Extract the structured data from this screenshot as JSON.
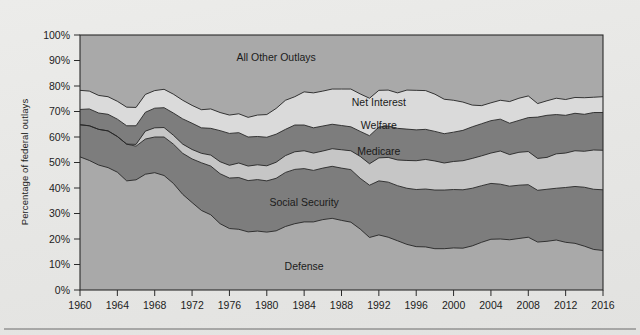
{
  "figure": {
    "background_color": "#e8e8e6",
    "plot_background_color": "#a7a7a7",
    "axis_color": "#2a2a2a",
    "has_bottom_rule": true
  },
  "chart_data": {
    "type": "area",
    "stacked": true,
    "title": "",
    "subtitle": "",
    "xlabel": "",
    "ylabel": "Percentage of federal outlays",
    "xlim": [
      1960,
      2016
    ],
    "ylim": [
      0,
      100
    ],
    "grid": false,
    "legend_position": "inline-labels",
    "ytick_labels": [
      "0%",
      "10%",
      "20%",
      "30%",
      "40%",
      "50%",
      "60%",
      "70%",
      "80%",
      "90%",
      "100%"
    ],
    "ytick_values": [
      0,
      10,
      20,
      30,
      40,
      50,
      60,
      70,
      80,
      90,
      100
    ],
    "xtick_labels": [
      "1960",
      "1964",
      "1968",
      "1972",
      "1976",
      "1980",
      "1984",
      "1988",
      "1992",
      "1996",
      "2000",
      "2004",
      "2008",
      "2012",
      "2016"
    ],
    "xtick_values": [
      1960,
      1964,
      1968,
      1972,
      1976,
      1980,
      1984,
      1988,
      1992,
      1996,
      2000,
      2004,
      2008,
      2012,
      2016
    ],
    "x": [
      1960,
      1961,
      1962,
      1963,
      1964,
      1965,
      1966,
      1967,
      1968,
      1969,
      1970,
      1971,
      1972,
      1973,
      1974,
      1975,
      1976,
      1977,
      1978,
      1979,
      1980,
      1981,
      1982,
      1983,
      1984,
      1985,
      1986,
      1987,
      1988,
      1989,
      1990,
      1991,
      1992,
      1993,
      1994,
      1995,
      1996,
      1997,
      1998,
      1999,
      2000,
      2001,
      2002,
      2003,
      2004,
      2005,
      2006,
      2007,
      2008,
      2009,
      2010,
      2011,
      2012,
      2013,
      2014,
      2015,
      2016
    ],
    "series": [
      {
        "name": "Defense",
        "color": "#a9a9a9",
        "label_x": 1984,
        "label_y": 8,
        "values": [
          52.2,
          50.8,
          49.0,
          48.0,
          46.2,
          42.8,
          43.2,
          45.4,
          46.0,
          44.9,
          41.8,
          37.5,
          34.3,
          31.2,
          29.5,
          26.0,
          24.1,
          23.8,
          22.8,
          23.1,
          22.7,
          23.2,
          24.9,
          26.0,
          26.7,
          26.7,
          27.6,
          28.1,
          27.3,
          26.6,
          23.9,
          20.6,
          21.6,
          20.7,
          19.3,
          17.9,
          17.0,
          16.9,
          16.2,
          16.2,
          16.5,
          16.4,
          17.3,
          18.7,
          19.9,
          20.0,
          19.7,
          20.2,
          20.7,
          18.8,
          19.1,
          19.6,
          18.7,
          18.3,
          17.2,
          15.9,
          15.5
        ]
      },
      {
        "name": "Social Security",
        "color": "#7d7d7d",
        "label_x": 1984,
        "label_y": 33,
        "values": [
          12.6,
          13.6,
          14.0,
          14.4,
          14.0,
          14.4,
          13.2,
          13.8,
          14.0,
          15.1,
          15.4,
          16.1,
          17.1,
          18.7,
          19.1,
          19.6,
          19.8,
          20.3,
          20.1,
          20.2,
          20.1,
          20.6,
          21.2,
          21.3,
          20.9,
          20.2,
          20.2,
          20.4,
          20.5,
          20.6,
          19.9,
          20.5,
          21.2,
          21.6,
          21.6,
          22.0,
          22.4,
          22.7,
          23.0,
          23.0,
          22.9,
          22.9,
          22.6,
          22.2,
          21.9,
          21.5,
          21.0,
          20.9,
          20.6,
          20.3,
          20.4,
          20.3,
          21.5,
          22.3,
          23.1,
          23.6,
          23.8
        ]
      },
      {
        "name": "Medicare",
        "color": "#c6c6c6",
        "label_x": 1992,
        "label_y": 53,
        "values": [
          0.0,
          0.0,
          0.0,
          0.0,
          0.0,
          0.0,
          0.7,
          3.1,
          3.6,
          3.7,
          3.5,
          3.6,
          3.7,
          3.7,
          4.3,
          4.7,
          5.0,
          5.7,
          5.7,
          5.8,
          5.9,
          6.3,
          6.6,
          6.9,
          7.0,
          6.8,
          6.7,
          6.9,
          7.2,
          7.4,
          8.6,
          8.4,
          9.0,
          9.7,
          10.1,
          10.9,
          11.3,
          11.6,
          11.4,
          10.6,
          11.0,
          11.4,
          11.7,
          11.7,
          11.9,
          13.0,
          12.4,
          12.9,
          13.0,
          12.5,
          12.5,
          13.5,
          13.5,
          14.0,
          14.1,
          15.4,
          15.5
        ]
      },
      {
        "name": "Welfare",
        "color": "#7d7d7d",
        "label_x": 1992,
        "label_y": 63,
        "values": [
          6.0,
          6.6,
          6.4,
          6.5,
          6.8,
          7.2,
          7.3,
          7.4,
          7.7,
          7.8,
          8.7,
          9.9,
          10.3,
          10.0,
          10.5,
          12.2,
          12.5,
          11.9,
          11.4,
          11.1,
          11.2,
          11.0,
          10.3,
          10.5,
          10.1,
          9.9,
          9.8,
          9.6,
          9.5,
          9.4,
          9.8,
          11.0,
          12.1,
          12.3,
          12.4,
          12.3,
          12.1,
          11.8,
          11.6,
          11.5,
          11.5,
          11.9,
          12.4,
          12.6,
          12.7,
          12.5,
          12.3,
          12.5,
          13.3,
          16.2,
          16.5,
          15.4,
          14.8,
          14.7,
          14.5,
          14.7,
          14.8
        ]
      },
      {
        "name": "Net Interest",
        "color": "#dadada",
        "label_x": 1992,
        "label_y": 72,
        "values": [
          7.5,
          7.0,
          6.9,
          6.9,
          7.0,
          7.3,
          7.2,
          7.0,
          6.9,
          7.2,
          7.4,
          7.3,
          7.0,
          7.1,
          7.6,
          7.1,
          7.2,
          7.4,
          7.7,
          8.4,
          8.9,
          10.1,
          11.4,
          11.1,
          13.0,
          13.7,
          13.7,
          13.8,
          14.3,
          14.8,
          14.7,
          14.7,
          14.4,
          14.1,
          13.9,
          15.3,
          15.5,
          15.2,
          14.6,
          13.5,
          12.5,
          11.1,
          8.5,
          7.1,
          7.0,
          7.4,
          8.5,
          8.7,
          8.5,
          5.3,
          5.7,
          6.4,
          6.2,
          6.2,
          6.5,
          6.0,
          6.2
        ]
      },
      {
        "name": "All Other Outlays",
        "color": "#a9a9a9",
        "label_x": 1981,
        "label_y": 90,
        "values": [
          21.7,
          22.0,
          23.7,
          24.2,
          26.0,
          28.3,
          28.4,
          23.3,
          21.8,
          21.3,
          23.2,
          25.6,
          27.6,
          29.3,
          29.0,
          30.4,
          31.4,
          30.9,
          32.3,
          31.4,
          31.2,
          28.8,
          25.6,
          24.2,
          22.3,
          22.7,
          22.0,
          21.2,
          21.2,
          21.2,
          23.1,
          24.8,
          21.7,
          21.6,
          22.7,
          21.6,
          21.7,
          21.8,
          23.2,
          25.2,
          25.6,
          26.3,
          27.5,
          27.7,
          26.6,
          25.6,
          26.1,
          24.8,
          23.9,
          26.9,
          25.8,
          24.8,
          25.3,
          24.5,
          24.6,
          24.4,
          24.2
        ]
      }
    ]
  }
}
